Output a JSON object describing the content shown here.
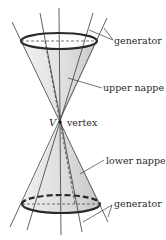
{
  "diagram": {
    "labels": {
      "generator_top": "generator",
      "upper_nappe": "upper nappe",
      "vertex_symbol": "V",
      "vertex": "vertex",
      "lower_nappe": "lower nappe",
      "generator_bottom": "generator"
    },
    "colors": {
      "cone_fill": "#dcdcdc",
      "outline": "#2a2a2a",
      "lines": "#3a3a3a"
    }
  }
}
